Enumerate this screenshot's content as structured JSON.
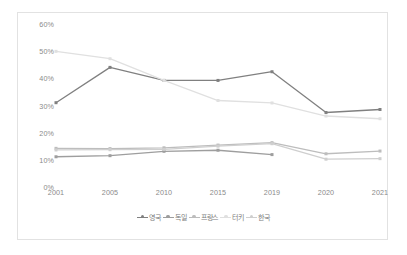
{
  "chart_data": {
    "type": "line",
    "title": "",
    "subtitle": "",
    "xlabel": "",
    "ylabel": "",
    "categories": [
      "2001",
      "2005",
      "2010",
      "2015",
      "2019",
      "2020",
      "2021"
    ],
    "ylim": [
      0,
      60
    ],
    "y_ticks": [
      "0%",
      "10%",
      "20%",
      "30%",
      "40%",
      "50%",
      "60%"
    ],
    "y_tick_values": [
      0,
      10,
      20,
      30,
      40,
      50,
      60
    ],
    "grid": false,
    "legend_position": "bottom",
    "series": [
      {
        "name": "영국",
        "color": "#808080",
        "marker": "square-dot",
        "values": [
          31.4,
          44.4,
          39.6,
          39.6,
          42.8,
          27.8,
          28.9
        ]
      },
      {
        "name": "독일",
        "color": "#9e9e9e",
        "marker": "square-dot",
        "values": [
          11.5,
          11.9,
          13.5,
          13.9,
          12.3,
          null,
          null
        ]
      },
      {
        "name": "프랑스",
        "color": "#bdbdbd",
        "marker": "square-dot",
        "values": [
          14.6,
          14.5,
          14.8,
          15.8,
          16.7,
          12.6,
          13.6
        ]
      },
      {
        "name": "터키",
        "color": "#e0e0e0",
        "marker": "square-dot",
        "values": [
          50.3,
          47.6,
          39.6,
          32.2,
          31.3,
          26.5,
          25.5
        ]
      },
      {
        "name": "한국",
        "color": "#cfcfcf",
        "marker": "square-dot",
        "values": [
          14.0,
          14.1,
          14.2,
          15.4,
          16.3,
          10.6,
          10.8
        ]
      }
    ]
  },
  "legend": {
    "items": [
      {
        "label": "영국"
      },
      {
        "label": "독일"
      },
      {
        "label": "프랑스"
      },
      {
        "label": "터키"
      },
      {
        "label": "한국"
      }
    ]
  }
}
